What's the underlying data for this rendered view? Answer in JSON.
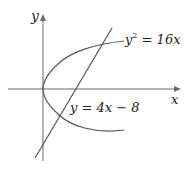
{
  "diagram": {
    "title": "",
    "axes": {
      "x_label": "x",
      "y_label": "y"
    },
    "curves": [
      {
        "id": "parabola",
        "equation": "y² = 16x",
        "label_var": "y",
        "label_exp": "2",
        "label_rest": " = 16x",
        "type": "parabola",
        "vertex": [
          0,
          0
        ]
      },
      {
        "id": "line",
        "equation": "y = 4x − 8",
        "label_text": "y = 4x − 8",
        "type": "line",
        "slope": 4,
        "intercept": -8
      }
    ],
    "intersections": [
      [
        1,
        -4
      ],
      [
        4,
        8
      ]
    ],
    "colors": {
      "stroke": "#555555",
      "axis": "#6a6a6a",
      "text": "#222222",
      "background": "#ffffff"
    }
  }
}
